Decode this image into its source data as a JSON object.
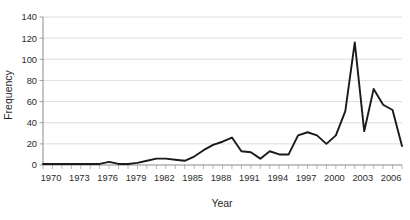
{
  "chart_data": {
    "type": "line",
    "title": "",
    "xlabel": "Year",
    "ylabel": "Frequency",
    "xlim": [
      1970,
      2008
    ],
    "ylim": [
      0,
      140
    ],
    "ytick_values": [
      0,
      20,
      40,
      60,
      80,
      100,
      120,
      140
    ],
    "ytick_labels": [
      "0",
      "20",
      "40",
      "60",
      "80",
      "100",
      "120",
      "140"
    ],
    "xtick_labels": [
      "1970",
      "1973",
      "1976",
      "1979",
      "1982",
      "1985",
      "1988",
      "1991",
      "1994",
      "1997",
      "2000",
      "2003",
      "2006"
    ],
    "xtick_values": [
      1970,
      1973,
      1976,
      1979,
      1982,
      1985,
      1988,
      1991,
      1994,
      1997,
      2000,
      2003,
      2006
    ],
    "grid": "horizontal",
    "legend": "none",
    "series": [
      {
        "name": "Frequency",
        "color": "#1a1a1a",
        "x": [
          1970,
          1971,
          1972,
          1973,
          1974,
          1975,
          1976,
          1977,
          1978,
          1979,
          1980,
          1981,
          1982,
          1983,
          1984,
          1985,
          1986,
          1987,
          1988,
          1989,
          1990,
          1991,
          1992,
          1993,
          1994,
          1995,
          1996,
          1997,
          1998,
          1999,
          2000,
          2001,
          2002,
          2003,
          2004,
          2005,
          2006,
          2007,
          2008
        ],
        "values": [
          1,
          1,
          1,
          1,
          1,
          1,
          1,
          3,
          1,
          1,
          2,
          4,
          6,
          6,
          5,
          4,
          8,
          14,
          19,
          22,
          26,
          13,
          12,
          6,
          13,
          10,
          10,
          28,
          31,
          28,
          20,
          28,
          51,
          116,
          32,
          72,
          57,
          52,
          18
        ]
      }
    ]
  },
  "axes": {
    "y_title": "Frequency",
    "x_title": "Year"
  }
}
